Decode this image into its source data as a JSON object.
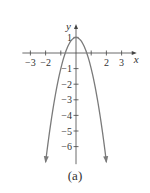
{
  "chart_data": {
    "type": "line",
    "title": "",
    "caption": "(a)",
    "xlabel": "x",
    "ylabel": "y",
    "function": "y = 1 - 2x^2",
    "xlim": [
      -3.2,
      3.6
    ],
    "ylim": [
      -7,
      1.8
    ],
    "x_ticks": [
      -3,
      -2,
      -1,
      1,
      2,
      3
    ],
    "x_tick_labels": [
      "−3",
      "−2",
      "",
      "",
      "2",
      "3"
    ],
    "y_ticks": [
      1,
      -1,
      -2,
      -3,
      -4,
      -5,
      -6
    ],
    "y_tick_labels": [
      "1",
      "−1",
      "−2",
      "−3",
      "−4",
      "−5",
      "−6"
    ],
    "series": [
      {
        "name": "parabola",
        "x": [
          -2,
          -1.5,
          -1,
          -0.5,
          0,
          0.5,
          1,
          1.5,
          2
        ],
        "values": [
          -7,
          -3.5,
          -1,
          0.5,
          1,
          0.5,
          -1,
          -3.5,
          -7
        ],
        "color": "#7a7a7a",
        "arrows_at_ends": true
      }
    ],
    "grid": false,
    "legend": null
  }
}
